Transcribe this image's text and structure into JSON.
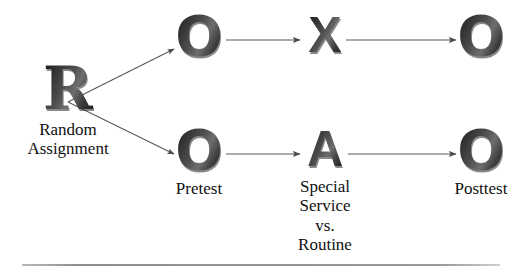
{
  "diagram": {
    "background_color": "#ffffff",
    "symbol_color": "#2b2b2b",
    "line_color": "#555555",
    "rule_color": "#9a9a9a",
    "nodes": {
      "randomization": {
        "symbol": "R",
        "caption_lines": [
          "Random",
          "Assignment"
        ]
      },
      "pretest_treatment": {
        "symbol": "O",
        "caption_lines": []
      },
      "treatment": {
        "symbol": "X",
        "caption_lines": []
      },
      "posttest_treatment": {
        "symbol": "O",
        "caption_lines": []
      },
      "pretest_control": {
        "symbol": "O",
        "caption_lines": [
          "Pretest"
        ]
      },
      "comparison": {
        "symbol": "A",
        "caption_lines": [
          "Special",
          "Service",
          "vs.",
          "Routine"
        ]
      },
      "posttest_control": {
        "symbol": "O",
        "caption_lines": [
          "Posttest"
        ]
      }
    },
    "edges": [
      {
        "name": "r-to-pretest-treatment",
        "from": "R",
        "to": "O (top)",
        "style": "arrow-diagonal-up"
      },
      {
        "name": "r-to-pretest-control",
        "from": "R",
        "to": "O (bottom)",
        "style": "arrow-diagonal-down"
      },
      {
        "name": "pretest-treatment-to-treatment",
        "from": "O (top)",
        "to": "X",
        "style": "arrow-horizontal"
      },
      {
        "name": "treatment-to-posttest-treatment",
        "from": "X",
        "to": "O (top right)",
        "style": "arrow-horizontal"
      },
      {
        "name": "pretest-control-to-comparison",
        "from": "O (bottom)",
        "to": "A",
        "style": "arrow-horizontal"
      },
      {
        "name": "comparison-to-posttest-control",
        "from": "A",
        "to": "O (bottom right)",
        "style": "arrow-horizontal"
      }
    ]
  }
}
